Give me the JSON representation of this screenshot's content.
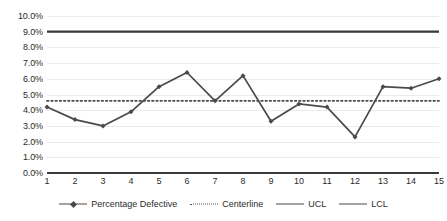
{
  "chart_data": {
    "type": "line",
    "title": "",
    "subtitle": "",
    "xlabel": "",
    "ylabel": "",
    "categories": [
      "1",
      "2",
      "3",
      "4",
      "5",
      "6",
      "7",
      "8",
      "9",
      "10",
      "11",
      "12",
      "13",
      "14",
      "15"
    ],
    "x": [
      1,
      2,
      3,
      4,
      5,
      6,
      7,
      8,
      9,
      10,
      11,
      12,
      13,
      14,
      15
    ],
    "ylim": [
      0,
      10
    ],
    "xlim": [
      1,
      15
    ],
    "grid": true,
    "legend_position": "bottom",
    "y_tick_labels": [
      "0.0%",
      "1.0%",
      "2.0%",
      "3.0%",
      "4.0%",
      "5.0%",
      "6.0%",
      "7.0%",
      "8.0%",
      "9.0%",
      "10.0%"
    ],
    "y_tick_values": [
      0,
      1,
      2,
      3,
      4,
      5,
      6,
      7,
      8,
      9,
      10
    ],
    "series": [
      {
        "name": "Percentage Defective",
        "style": "line-marker",
        "color": "#4a4a4a",
        "values": [
          4.2,
          3.4,
          3.0,
          3.9,
          5.5,
          6.4,
          4.6,
          6.2,
          3.3,
          4.4,
          4.2,
          2.3,
          5.5,
          5.4,
          6.0
        ]
      },
      {
        "name": "Centerline",
        "style": "dotted",
        "color": "#4a4a4a",
        "constant": 4.6
      },
      {
        "name": "UCL",
        "style": "solid",
        "color": "#3a3a3a",
        "constant": 9.0
      },
      {
        "name": "LCL",
        "style": "solid",
        "color": "#3a3a3a",
        "constant": 0.0
      }
    ]
  },
  "legend": {
    "items": [
      {
        "label": "Percentage Defective",
        "swatch": "line-marker"
      },
      {
        "label": "Centerline",
        "swatch": "dotted"
      },
      {
        "label": "UCL",
        "swatch": "solid"
      },
      {
        "label": "LCL",
        "swatch": "solid"
      }
    ]
  },
  "colors": {
    "series_line": "#4a4a4a",
    "control_limit": "#3a3a3a",
    "gridline": "#eceaea",
    "text": "#2b2b2b",
    "background": "#ffffff"
  }
}
